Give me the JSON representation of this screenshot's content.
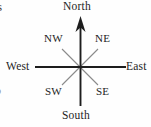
{
  "figure": {
    "kind": "compass-rose-diagram",
    "width": 151,
    "height": 127,
    "background_color": "#fefefe"
  },
  "compass": {
    "center": {
      "x": 80,
      "y": 67
    },
    "axis_color": "#1d1d1d",
    "diagonal_color": "#8a8a8a",
    "arrow_color": "#1d1d1d",
    "axis_half_length_horizontal": 46,
    "axis_half_length_vertical": 50,
    "diagonal_half_length": 25,
    "north_has_arrowhead": true,
    "labels": {
      "north": "North",
      "south": "South",
      "west": "West",
      "east": "East",
      "northwest": "NW",
      "northeast": "NE",
      "southwest": "SW",
      "southeast": "SE"
    }
  },
  "edge_artifacts": {
    "top_left_fragment": "s",
    "middle_left_fragment": "o",
    "lower_left_fragment": "-"
  }
}
